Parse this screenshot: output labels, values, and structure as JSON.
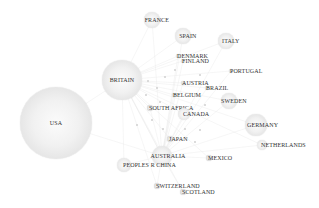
{
  "diagram": {
    "type": "network-bubble",
    "nodes": [
      {
        "id": "usa",
        "label": "USA",
        "x": 56,
        "y": 123,
        "r": 36
      },
      {
        "id": "britain",
        "label": "BRITAIN",
        "x": 122,
        "y": 80,
        "r": 20
      },
      {
        "id": "france",
        "label": "FRANCE",
        "x": 152,
        "y": 20,
        "r": 8
      },
      {
        "id": "spain",
        "label": "SPAIN",
        "x": 183,
        "y": 36,
        "r": 8
      },
      {
        "id": "italy",
        "label": "ITALY",
        "x": 226,
        "y": 41,
        "r": 8
      },
      {
        "id": "denmark",
        "label": "DENMARK",
        "x": 178,
        "y": 56,
        "r": 2
      },
      {
        "id": "finland",
        "label": "FINLAND",
        "x": 183,
        "y": 61,
        "r": 2
      },
      {
        "id": "portugal",
        "label": "PORTUGAL",
        "x": 231,
        "y": 71,
        "r": 2
      },
      {
        "id": "austria",
        "label": "AUSTRIA",
        "x": 183,
        "y": 83,
        "r": 2
      },
      {
        "id": "brazil",
        "label": "BRAZIL",
        "x": 207,
        "y": 88,
        "r": 2
      },
      {
        "id": "belgium",
        "label": "BELGIUM",
        "x": 174,
        "y": 95,
        "r": 2
      },
      {
        "id": "sweden",
        "label": "SWEDEN",
        "x": 229,
        "y": 101,
        "r": 8
      },
      {
        "id": "south-africa",
        "label": "SOUTH AFRICA",
        "x": 150,
        "y": 108,
        "r": 3
      },
      {
        "id": "canada",
        "label": "CANADA",
        "x": 184,
        "y": 114,
        "r": 6
      },
      {
        "id": "germany",
        "label": "GERMANY",
        "x": 256,
        "y": 125,
        "r": 11
      },
      {
        "id": "netherlands",
        "label": "NETHERLANDS",
        "x": 262,
        "y": 145,
        "r": 5
      },
      {
        "id": "japan",
        "label": "JAPAN",
        "x": 170,
        "y": 139,
        "r": 3
      },
      {
        "id": "australia",
        "label": "AUSTRALIA",
        "x": 162,
        "y": 156,
        "r": 10
      },
      {
        "id": "mexico",
        "label": "MEXICO",
        "x": 209,
        "y": 158,
        "r": 3
      },
      {
        "id": "peoples-r-china",
        "label": "PEOPLES R CHINA",
        "x": 124,
        "y": 165,
        "r": 7
      },
      {
        "id": "switzerland",
        "label": "SWITZERLAND",
        "x": 157,
        "y": 186,
        "r": 3
      },
      {
        "id": "scotland",
        "label": "SCOTLAND",
        "x": 183,
        "y": 192,
        "r": 3
      }
    ],
    "minor_dots": [
      {
        "x": 157,
        "y": 88
      },
      {
        "x": 165,
        "y": 77
      },
      {
        "x": 148,
        "y": 81
      },
      {
        "x": 163,
        "y": 129
      },
      {
        "x": 185,
        "y": 129
      },
      {
        "x": 200,
        "y": 130
      },
      {
        "x": 175,
        "y": 70
      },
      {
        "x": 200,
        "y": 75
      },
      {
        "x": 195,
        "y": 142
      },
      {
        "x": 152,
        "y": 120
      },
      {
        "x": 146,
        "y": 95
      },
      {
        "x": 205,
        "y": 105
      },
      {
        "x": 137,
        "y": 125
      },
      {
        "x": 160,
        "y": 102
      }
    ],
    "colors": {
      "node_fill": "#efefef",
      "node_edge": "#d6d6d6",
      "label": "#333333",
      "edge": "#e8e8e8"
    }
  }
}
